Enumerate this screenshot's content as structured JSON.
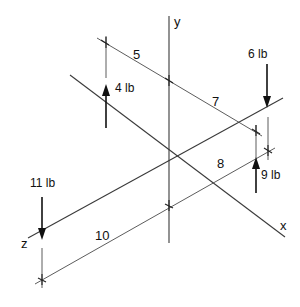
{
  "diagram": {
    "type": "isometric force diagram",
    "axes": {
      "x": {
        "label": "x"
      },
      "y": {
        "label": "y"
      },
      "z": {
        "label": "z"
      }
    },
    "forces": [
      {
        "id": "f4",
        "label": "4 lb",
        "magnitude": 4,
        "unit": "lb",
        "direction": "up"
      },
      {
        "id": "f6",
        "label": "6 lb",
        "magnitude": 6,
        "unit": "lb",
        "direction": "down"
      },
      {
        "id": "f9",
        "label": "9 lb",
        "magnitude": 9,
        "unit": "lb",
        "direction": "up"
      },
      {
        "id": "f11",
        "label": "11 lb",
        "magnitude": 11,
        "unit": "lb",
        "direction": "down"
      }
    ],
    "dimensions": [
      {
        "id": "d5",
        "label": "5",
        "value": 5
      },
      {
        "id": "d7",
        "label": "7",
        "value": 7
      },
      {
        "id": "d8",
        "label": "8",
        "value": 8
      },
      {
        "id": "d10",
        "label": "10",
        "value": 10
      }
    ],
    "colors": {
      "line": "#3a3a3a",
      "arrow": "#111111",
      "background": "#ffffff"
    }
  }
}
